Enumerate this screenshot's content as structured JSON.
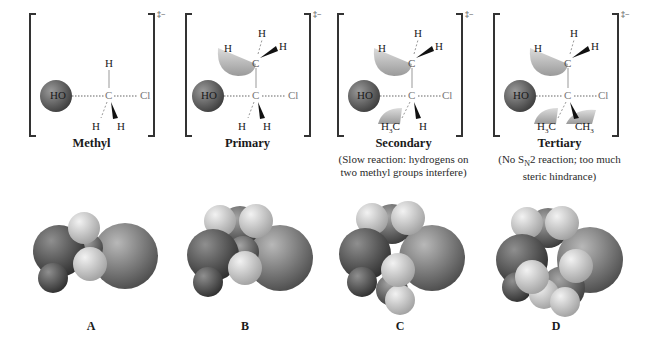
{
  "figure": {
    "charge_symbol": "‡−",
    "atoms": {
      "nucleophile": "HO",
      "leaving_group": "Cl",
      "carbon": "C",
      "hydrogen": "H",
      "methyl_left": "H3C",
      "methyl_right": "CH3"
    },
    "colors": {
      "oxygen": "#6e6e6e",
      "chlorine": "#8c8c8c",
      "hydrogen": "#d4d4d4",
      "carbon": "#7a7a7a",
      "bond": "#8a8a8a",
      "text": "#1a1a1a"
    },
    "panels": [
      {
        "id": "methyl",
        "title": "Methyl",
        "note_line1": "",
        "note_line2": ""
      },
      {
        "id": "primary",
        "title": "Primary",
        "note_line1": "",
        "note_line2": ""
      },
      {
        "id": "secondary",
        "title": "Secondary",
        "note_line1": "(Slow reaction: hydrogens on",
        "note_line2": "two methyl groups interfere)"
      },
      {
        "id": "tertiary",
        "title": "Tertiary",
        "note_prefix": "(No S",
        "note_sub": "N",
        "note_suffix": "2 reaction; too much",
        "note_line2": "steric hindrance)"
      }
    ],
    "space_filling_labels": [
      "A",
      "B",
      "C",
      "D"
    ]
  }
}
